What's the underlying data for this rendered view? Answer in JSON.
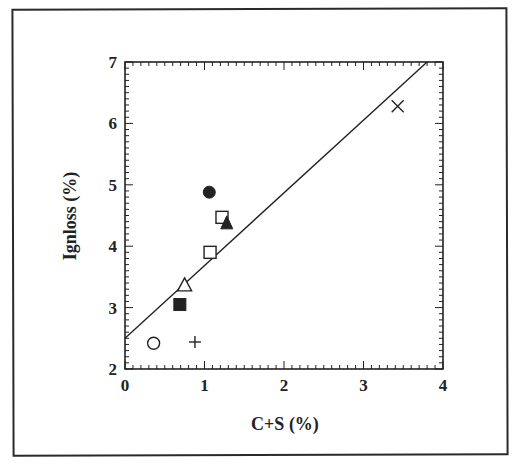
{
  "chart_data": {
    "type": "scatter",
    "title": "",
    "xlabel": "C+S (%)",
    "ylabel": "Ignloss (%)",
    "xlim": [
      0,
      4
    ],
    "ylim": [
      2,
      7
    ],
    "x_ticks": [
      "0",
      "1",
      "2",
      "3",
      "4"
    ],
    "y_ticks": [
      "2",
      "3",
      "4",
      "5",
      "6",
      "7"
    ],
    "grid": false,
    "legend": null,
    "series": [
      {
        "name": "open-circle",
        "marker": "circle-open",
        "x": [
          0.36
        ],
        "y": [
          2.42
        ]
      },
      {
        "name": "plus",
        "marker": "plus",
        "x": [
          0.88
        ],
        "y": [
          2.44
        ]
      },
      {
        "name": "filled-square",
        "marker": "square-filled",
        "x": [
          0.69
        ],
        "y": [
          3.05
        ]
      },
      {
        "name": "open-triangle",
        "marker": "triangle-open",
        "x": [
          0.75
        ],
        "y": [
          3.37
        ]
      },
      {
        "name": "open-square-a",
        "marker": "square-open",
        "x": [
          1.07
        ],
        "y": [
          3.9
        ]
      },
      {
        "name": "open-square-b",
        "marker": "square-open",
        "x": [
          1.22
        ],
        "y": [
          4.47
        ]
      },
      {
        "name": "filled-triangle",
        "marker": "triangle-filled",
        "x": [
          1.28
        ],
        "y": [
          4.38
        ]
      },
      {
        "name": "filled-circle",
        "marker": "circle-filled",
        "x": [
          1.06
        ],
        "y": [
          4.88
        ]
      },
      {
        "name": "cross",
        "marker": "x",
        "x": [
          3.43
        ],
        "y": [
          6.28
        ]
      }
    ],
    "fit_line": {
      "x": [
        0,
        3.8
      ],
      "y": [
        2.5,
        7.0
      ],
      "slope": 1.18,
      "intercept": 2.5
    }
  }
}
